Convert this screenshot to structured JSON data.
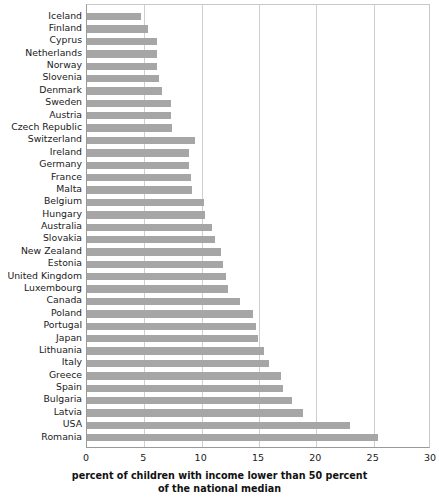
{
  "chart_data": {
    "type": "bar",
    "orientation": "horizontal",
    "title": "",
    "xlabel": "percent of children with income lower than 50 percent of the national median",
    "xlabel_lines": [
      "percent of children with income lower than 50 percent",
      "of the national median"
    ],
    "ylabel": "",
    "xlim": [
      0,
      30
    ],
    "xticks": [
      0,
      5,
      10,
      15,
      20,
      25,
      30
    ],
    "xtick_labels": [
      "0",
      "5",
      "10",
      "15",
      "20",
      "25",
      "30"
    ],
    "grid": true,
    "grid_axis": "x",
    "legend": false,
    "bar_color": "#a6a6a6",
    "categories": [
      "Iceland",
      "Finland",
      "Cyprus",
      "Netherlands",
      "Norway",
      "Slovenia",
      "Denmark",
      "Sweden",
      "Austria",
      "Czech Republic",
      "Switzerland",
      "Ireland",
      "Germany",
      "France",
      "Malta",
      "Belgium",
      "Hungary",
      "Australia",
      "Slovakia",
      "New Zealand",
      "Estonia",
      "United Kingdom",
      "Luxembourg",
      "Canada",
      "Poland",
      "Portugal",
      "Japan",
      "Lithuania",
      "Italy",
      "Greece",
      "Spain",
      "Bulgaria",
      "Latvia",
      "USA",
      "Romania"
    ],
    "values": [
      4.7,
      5.3,
      6.1,
      6.1,
      6.1,
      6.3,
      6.5,
      7.3,
      7.3,
      7.4,
      9.4,
      8.9,
      8.9,
      9.1,
      9.2,
      10.2,
      10.3,
      10.9,
      11.2,
      11.7,
      11.9,
      12.1,
      12.3,
      13.3,
      14.5,
      14.7,
      14.9,
      15.4,
      15.9,
      16.9,
      17.1,
      17.9,
      18.8,
      22.9,
      25.4
    ]
  },
  "axis": {
    "x_title_line1": "percent of children with income lower than 50 percent",
    "x_title_line2": "of the national median"
  }
}
